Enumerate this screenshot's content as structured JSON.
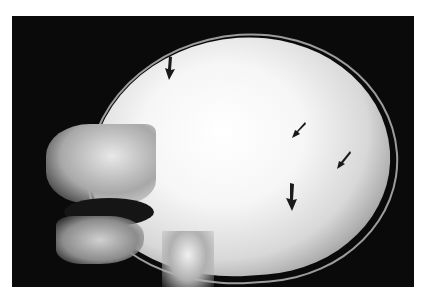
{
  "image": {
    "description": "Lateral skull radiograph with four dark arrows",
    "background": "#ffffff",
    "film_color": "#0a0a0a",
    "arrow_color": "#1a1a1a"
  },
  "arrows": [
    {
      "id": "arrow-1",
      "x": 165,
      "y": 58,
      "direction": "down-curved"
    },
    {
      "id": "arrow-2",
      "x": 292,
      "y": 123,
      "direction": "down-left"
    },
    {
      "id": "arrow-3",
      "x": 337,
      "y": 152,
      "direction": "down-left"
    },
    {
      "id": "arrow-4",
      "x": 286,
      "y": 184,
      "direction": "down-curved"
    }
  ]
}
